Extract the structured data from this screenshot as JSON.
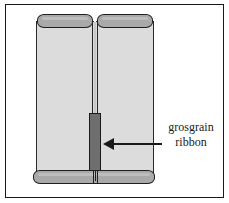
{
  "figure": {
    "background_color": "#ffffff",
    "frame_color": "#1a1a1a"
  },
  "colors": {
    "panel_fill": "#dcdcdc",
    "rod_fill": "#a9a9a9",
    "ribbon_fill": "#6e6e6e",
    "outline": "#1a1a1a"
  },
  "parts": {
    "panel_left": "left curtain panel",
    "panel_right": "right curtain panel",
    "seam": "center seam between panels",
    "rod_top_left": "left top rod",
    "rod_top_right": "right top rod",
    "rod_bottom": "bottom rod",
    "ribbon": "grosgrain ribbon strip"
  },
  "callout": {
    "arrow": "left-pointing arrow",
    "label_line_1": "grosgrain",
    "label_line_2": "ribbon"
  }
}
